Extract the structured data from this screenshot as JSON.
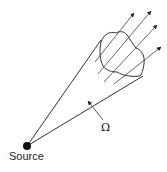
{
  "diagram": {
    "labels": {
      "source": "Source",
      "solid_angle": "Ω"
    },
    "colors": {
      "stroke": "#333333",
      "ray": "#555555",
      "source_dot": "#111111"
    },
    "elements": {
      "source_point": {
        "x": 27,
        "y": 146,
        "r": 4
      },
      "cone_edges": [
        {
          "x1": 27,
          "y1": 146,
          "x2": 101,
          "y2": 40
        },
        {
          "x1": 27,
          "y1": 146,
          "x2": 143,
          "y2": 76
        }
      ],
      "rays": [
        {
          "x1": 95,
          "y1": 62,
          "x2": 134,
          "y2": 13
        },
        {
          "x1": 98,
          "y1": 74,
          "x2": 151,
          "y2": 11
        },
        {
          "x1": 104,
          "y1": 82,
          "x2": 157,
          "y2": 25
        },
        {
          "x1": 114,
          "y1": 84,
          "x2": 161,
          "y2": 47
        }
      ],
      "omega_pointer": {
        "x1": 103,
        "y1": 120,
        "x2": 88,
        "y2": 101
      }
    }
  }
}
